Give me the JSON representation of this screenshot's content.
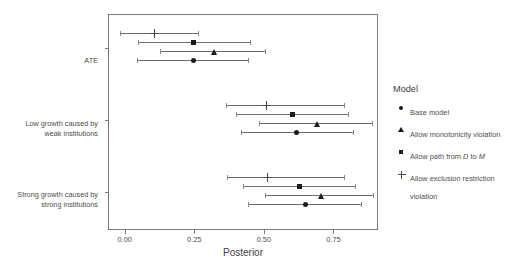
{
  "chart_data": {
    "type": "scatter",
    "title": "",
    "xlabel": "Posterior",
    "ylabel": "",
    "xlim": [
      -0.06,
      0.91
    ],
    "xticks": [
      0.0,
      0.25,
      0.5,
      0.75
    ],
    "xticklabels": [
      "0.00",
      "0.25",
      "0.50",
      "0.75"
    ],
    "grid": false,
    "legend_position": "right",
    "legend_title": "Model",
    "categories": [
      "ATE",
      "Low growth caused by\nweak institutions",
      "Strong growth caused by\nstrong institutions"
    ],
    "series": [
      {
        "name": "Base model",
        "marker": "circle",
        "values": [
          0.245,
          0.615,
          0.645
        ],
        "ci_low": [
          0.04,
          0.415,
          0.44
        ],
        "ci_high": [
          0.44,
          0.815,
          0.845
        ]
      },
      {
        "name": "Allow monotonicity violation",
        "marker": "triangle",
        "values": [
          0.32,
          0.69,
          0.705
        ],
        "ci_low": [
          0.125,
          0.48,
          0.5
        ],
        "ci_high": [
          0.5,
          0.885,
          0.89
        ]
      },
      {
        "name": "Allow path from D to M",
        "marker": "square",
        "values": [
          0.245,
          0.6,
          0.625
        ],
        "ci_low": [
          0.045,
          0.395,
          0.42
        ],
        "ci_high": [
          0.445,
          0.8,
          0.825
        ]
      },
      {
        "name": "Allow exclusion restriction violation",
        "marker": "plus",
        "values": [
          0.105,
          0.505,
          0.51
        ],
        "ci_low": [
          -0.02,
          0.36,
          0.365
        ],
        "ci_high": [
          0.26,
          0.785,
          0.785
        ]
      }
    ]
  },
  "legend": {
    "title": "Model",
    "items": [
      {
        "marker": "circle",
        "label": "Base model"
      },
      {
        "marker": "triangle",
        "label": "Allow monotonicity violation"
      },
      {
        "marker": "square",
        "label": "Allow path from D to M",
        "italic_parts": [
          "D",
          "M"
        ]
      },
      {
        "marker": "plus",
        "label": "Allow exclusion restriction violation"
      }
    ]
  },
  "axes": {
    "x_title": "Posterior",
    "x_tick_labels": [
      "0.00",
      "0.25",
      "0.50",
      "0.75"
    ],
    "y_tick_labels": [
      "ATE",
      "Low growth caused by\nweak institutions",
      "Strong growth caused by\nstrong institutions"
    ]
  }
}
